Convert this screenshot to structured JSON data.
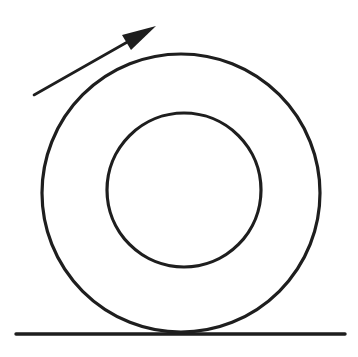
{
  "diagram": {
    "background": "#ffffff",
    "stroke_color": "#1e1e1e",
    "elements": {
      "outer_circle": {
        "cx": 181,
        "cy": 193,
        "r": 139,
        "stroke_width": 3.2
      },
      "inner_circle": {
        "cx": 184,
        "cy": 190,
        "r": 77,
        "stroke_width": 3.2
      },
      "ground_line": {
        "x1": 16,
        "y1": 334,
        "x2": 345,
        "y2": 334,
        "stroke_width": 3.4
      },
      "motion_arrow": {
        "tail": [
          34,
          95
        ],
        "head_tip": [
          156,
          26
        ],
        "head_base_left": [
          122,
          35
        ],
        "head_base_right": [
          131,
          50
        ],
        "stroke_width": 2.6
      }
    },
    "labels": []
  }
}
